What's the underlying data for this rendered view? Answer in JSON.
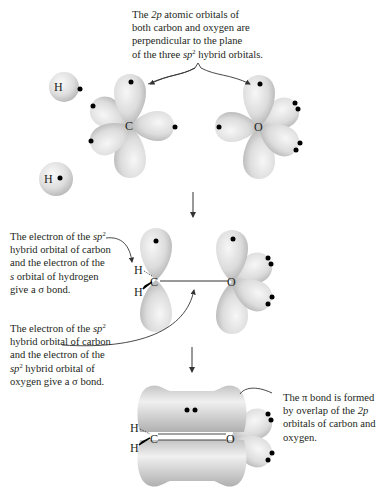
{
  "captions": {
    "top": {
      "lines": [
        {
          "pre": "The ",
          "it": "2p",
          "post": " atomic orbitals of"
        },
        {
          "pre": "both carbon and oxygen are",
          "it": "",
          "post": ""
        },
        {
          "pre": "perpendicular to the plane",
          "it": "",
          "post": ""
        },
        {
          "pre": "of the three ",
          "it": "sp",
          "sup": "2",
          "post": " hybrid orbitals."
        }
      ]
    },
    "middle_upper": {
      "lines": [
        {
          "pre": "The electron of the ",
          "it": "sp",
          "sup": "2",
          "post": ""
        },
        {
          "pre": "hybrid orbital of carbon",
          "it": "",
          "post": ""
        },
        {
          "pre": "and the electron of the",
          "it": "",
          "post": ""
        },
        {
          "pre": "",
          "it": "s",
          "post": " orbital of hydrogen"
        },
        {
          "pre": "give a σ bond.",
          "it": "",
          "post": ""
        }
      ]
    },
    "middle_lower": {
      "lines": [
        {
          "pre": "The electron of the ",
          "it": "sp",
          "sup": "2",
          "post": ""
        },
        {
          "pre": "hybrid orbital of carbon",
          "it": "",
          "post": ""
        },
        {
          "pre": "and the electron of the",
          "it": "",
          "post": ""
        },
        {
          "pre": "",
          "it": "sp",
          "sup": "2",
          "post": " hybrid orbital of"
        },
        {
          "pre": "oxygen give a σ bond.",
          "it": "",
          "post": ""
        }
      ]
    },
    "bottom": {
      "lines": [
        {
          "pre": "The π bond is formed",
          "it": "",
          "post": ""
        },
        {
          "pre": "by overlap of the ",
          "it": "2p",
          "post": ""
        },
        {
          "pre": "orbitals of carbon and",
          "it": "",
          "post": ""
        },
        {
          "pre": "oxygen.",
          "it": "",
          "post": ""
        }
      ]
    }
  },
  "atoms": {
    "carbon": "C",
    "oxygen": "O",
    "hydrogen": "H"
  },
  "colors": {
    "orbital_fill": "#d9d9d9",
    "orbital_highlight": "#f4f4f4",
    "orbital_shadow": "#a8a8a8",
    "electron": "#000000",
    "text": "#231f20",
    "arrow": "#333333"
  },
  "steps": [
    {
      "name": "separate-atoms",
      "description": "Two H atoms, sp2 carbon, sp2 oxygen"
    },
    {
      "name": "sigma-bonds",
      "description": "C-H and C-O sigma bonds formed"
    },
    {
      "name": "pi-bond",
      "description": "pi bond from overlap of 2p orbitals"
    }
  ]
}
